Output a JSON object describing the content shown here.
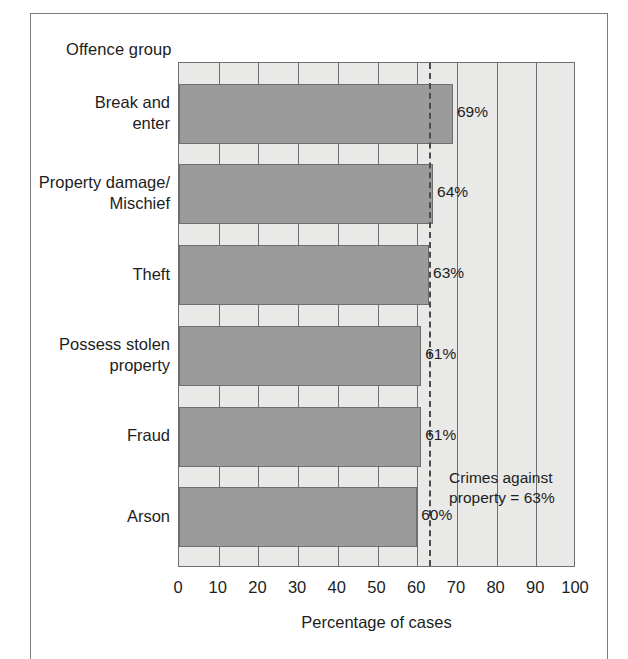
{
  "figure": {
    "category_axis_title": "Offence group",
    "value_axis_title": "Percentage of cases"
  },
  "annotation": {
    "line1": "Crimes against",
    "line2": "property = 63%"
  },
  "chart_data": {
    "type": "bar",
    "orientation": "horizontal",
    "title": "",
    "xlabel": "Percentage of cases",
    "ylabel": "Offence group",
    "xlim": [
      0,
      100
    ],
    "xticks": [
      0,
      10,
      20,
      30,
      40,
      50,
      60,
      70,
      80,
      90,
      100
    ],
    "xtick_labels": [
      "0",
      "10",
      "20",
      "30",
      "40",
      "50",
      "60",
      "70",
      "80",
      "90",
      "100"
    ],
    "grid": true,
    "legend": "none",
    "categories": [
      "Break and\nenter",
      "Property damage/\nMischief",
      "Theft",
      "Possess stolen\nproperty",
      "Fraud",
      "Arson"
    ],
    "category_lines": [
      [
        "Break and",
        "enter"
      ],
      [
        "Property damage/",
        "Mischief"
      ],
      [
        "Theft"
      ],
      [
        "Possess stolen",
        "property"
      ],
      [
        "Fraud"
      ],
      [
        "Arson"
      ]
    ],
    "values": [
      69,
      64,
      63,
      61,
      61,
      60
    ],
    "value_labels": [
      "69%",
      "64%",
      "63%",
      "61%",
      "61%",
      "60%"
    ],
    "reference_line": {
      "label": "Crimes against property = 63%",
      "value": 63,
      "style": "dashed"
    },
    "colors": {
      "bar_fill": "#9a9b9a",
      "bar_edge": "#6f6f6f",
      "plot_background": "#e9e9e7",
      "gridline": "#6f6f6f",
      "reference_line": "#4a4a4a",
      "text": "#1d1d1d"
    }
  }
}
